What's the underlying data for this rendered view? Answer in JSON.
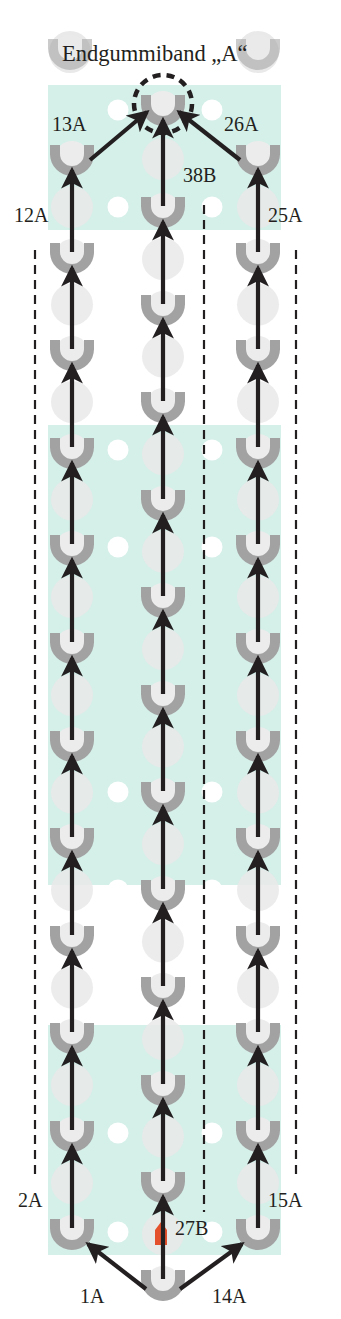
{
  "title": "Endgummiband „A“",
  "colors": {
    "teal": "#d5efe9",
    "peg_gray": "#a2a2a2",
    "peg_light": "#ececec",
    "peg_ghost": "#e9e9e9",
    "hole_white": "#ffffff",
    "arrow": "#231f20",
    "dash": "#231f20",
    "marker_red": "#e4502c"
  },
  "layout": {
    "width": 341,
    "height": 1319,
    "column_x": {
      "left": 72,
      "center": 163,
      "right": 258
    },
    "hole_x": [
      118,
      212
    ],
    "teal_x": [
      48,
      281
    ],
    "teal_blocks": [
      {
        "y0": 85,
        "y1": 230
      },
      {
        "y0": 425,
        "y1": 885
      },
      {
        "y0": 1025,
        "y1": 1255
      }
    ],
    "white_holes_y": [
      110,
      207,
      450,
      547,
      792,
      890,
      1133,
      1232
    ],
    "dashed_lines": [
      {
        "name": "left-guide",
        "x": 35,
        "y0": 250,
        "y1": 1180
      },
      {
        "name": "center-guide",
        "x": 204,
        "y0": 205,
        "y1": 1212
      },
      {
        "name": "right-guide",
        "x": 296,
        "y0": 250,
        "y1": 1180
      }
    ],
    "end_circle": {
      "cx": 163,
      "cy": 104,
      "r": 29
    },
    "top_ghost_pegs": [
      {
        "cx": 70,
        "cy": 52
      },
      {
        "cx": 258,
        "cy": 52
      }
    ],
    "red_marker": {
      "x": 155,
      "y": 1222,
      "w": 12,
      "h": 23
    }
  },
  "columns": {
    "left": {
      "label": "A",
      "pegs_y": [
        158,
        256,
        353,
        451,
        548,
        646,
        744,
        841,
        939,
        1036,
        1134,
        1232
      ]
    },
    "center": {
      "label": "B",
      "pegs_y": [
        1283,
        1185,
        1088,
        990,
        893,
        795,
        698,
        600,
        503,
        405,
        308,
        210,
        108
      ]
    },
    "right": {
      "label": "A",
      "pegs_y": [
        158,
        256,
        353,
        451,
        548,
        646,
        744,
        841,
        939,
        1036,
        1134,
        1232
      ]
    }
  },
  "labels": [
    {
      "text": "13A",
      "x": 52,
      "y": 131
    },
    {
      "text": "26A",
      "x": 224,
      "y": 131
    },
    {
      "text": "38B",
      "x": 183,
      "y": 182
    },
    {
      "text": "12A",
      "x": 14,
      "y": 222
    },
    {
      "text": "25A",
      "x": 268,
      "y": 222
    },
    {
      "text": "2A",
      "x": 18,
      "y": 1207
    },
    {
      "text": "15A",
      "x": 268,
      "y": 1207
    },
    {
      "text": "27B",
      "x": 175,
      "y": 1235
    },
    {
      "text": "1A",
      "x": 80,
      "y": 1303
    },
    {
      "text": "14A",
      "x": 212,
      "y": 1303
    }
  ]
}
